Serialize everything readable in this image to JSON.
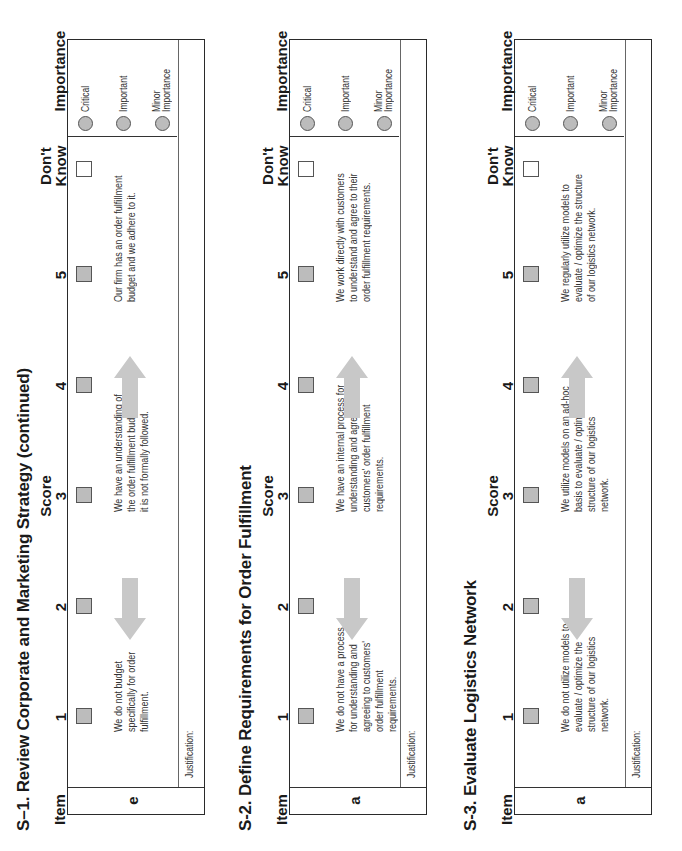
{
  "headers": {
    "item": "Item",
    "score": "Score",
    "scores": [
      "1",
      "2",
      "3",
      "4",
      "5"
    ],
    "dont_know": [
      "Don't",
      "Know"
    ],
    "importance": "Importance"
  },
  "importance_options": [
    "Critical",
    "Important",
    "Minor Importance"
  ],
  "justification_label": "Justification:",
  "sections": [
    {
      "title": "S–1. Review Corporate and Marketing Strategy (continued)",
      "item": "e",
      "desc1": [
        "We do not budget",
        "specifically for order",
        "fulfillment."
      ],
      "desc3": [
        "We have an understanding of",
        "the order fulfillment budget, but",
        "it is not formally followed."
      ],
      "desc5": [
        "Our firm has an order fulfillment",
        "budget and we adhere to it."
      ]
    },
    {
      "title": "S-2. Define Requirements for Order Fulfillment",
      "item": "a",
      "desc1": [
        "We do not have a process",
        "for understanding and",
        "agreeing to customers'",
        "order fulfillment",
        "requirements."
      ],
      "desc3": [
        "We have an internal process for",
        "understanding and agreeing to",
        "customers' order fulfillment",
        "requirements."
      ],
      "desc5": [
        "We work directly with customers",
        "to understand and agree to their",
        "order fulfillment requirements."
      ]
    },
    {
      "title": "S-3. Evaluate Logistics Network",
      "item": "a",
      "desc1": [
        "We do not utilize models to",
        "evaluate / optimize the",
        "structure of our logistics",
        "network."
      ],
      "desc3": [
        "We utilize models on an ad-hoc",
        "basis to evaluate / optimize the",
        "structure of our logistics",
        "network."
      ],
      "desc5": [
        "We regularly utilize models to",
        "evaluate / optimize the structure",
        "of our logistics network."
      ]
    }
  ],
  "colors": {
    "box_fill": "#bcbcbc",
    "arrow": "#c8c8c8",
    "border": "#2a2a2a"
  }
}
